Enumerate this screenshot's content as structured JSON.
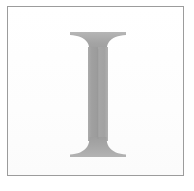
{
  "plate": {
    "background_color": "#ffffff",
    "width": 194,
    "height": 191
  },
  "frame": {
    "name": "rectangular-border",
    "border_color": "#9c9c9c",
    "border_width_px": 1,
    "fill_color": "#fdfdfd",
    "left": 7,
    "top": 6,
    "width": 177,
    "height": 170
  },
  "glyph": {
    "character": "I",
    "description": "uppercase serif letter I",
    "typeface_style": "old-style serif with bracketed slab serifs",
    "fill_color": "#a3a3a3",
    "shade_light": "#b4b4b4",
    "shade_dark": "#949494",
    "stem_width_px": 20,
    "serif_width_px": 55,
    "cap_top_y": 31,
    "baseline_y": 156,
    "center_x": 97
  }
}
